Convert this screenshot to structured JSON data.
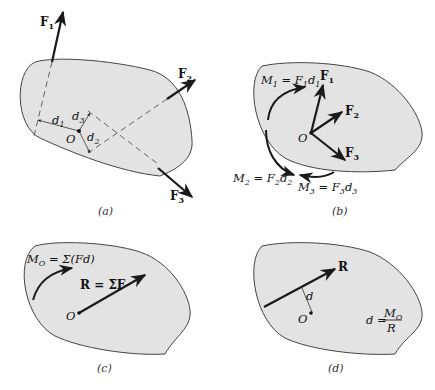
{
  "panels": [
    {
      "id": "a",
      "caption": "(a)",
      "labels": {
        "F1": "F",
        "F1_sub": "1",
        "F2": "F",
        "F2_sub": "2",
        "F3": "F",
        "F3_sub": "3",
        "d1": "d",
        "d1_sub": "1",
        "d2": "d",
        "d2_sub": "2",
        "d3": "d",
        "d3_sub": "3",
        "O": "O"
      }
    },
    {
      "id": "b",
      "caption": "(b)",
      "labels": {
        "F1": "F",
        "F1_sub": "1",
        "F2": "F",
        "F2_sub": "2",
        "F3": "F",
        "F3_sub": "3",
        "O": "O",
        "M1": "M",
        "M1_sub": "1",
        "M1_eq": " = F",
        "M1_eq_sub": "1",
        "M1_d": "d",
        "M1_d_sub": "1",
        "M2": "M",
        "M2_sub": "2",
        "M2_eq": " = F",
        "M2_eq_sub": "2",
        "M2_d": "d",
        "M2_d_sub": "2",
        "M3": "M",
        "M3_sub": "3",
        "M3_eq": " = F",
        "M3_eq_sub": "3",
        "M3_d": "d",
        "M3_d_sub": "3"
      }
    },
    {
      "id": "c",
      "caption": "(c)",
      "labels": {
        "MO": "M",
        "MO_sub": "O",
        "MO_eq": " = Σ(Fd)",
        "R_eq": "R = ΣF",
        "O": "O"
      }
    },
    {
      "id": "d",
      "caption": "(d)",
      "labels": {
        "R": "R",
        "d": "d",
        "O": "O",
        "formula_lhs": "d = ",
        "formula_num": "M",
        "formula_num_sub": "O",
        "formula_den": "R"
      }
    }
  ],
  "colors": {
    "body_fill": "#e3e3e3",
    "body_stroke": "#444444",
    "arrow": "#1a1a1a"
  }
}
